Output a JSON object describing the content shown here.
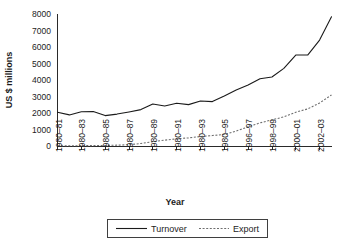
{
  "chart_data": {
    "type": "line",
    "title": "",
    "xlabel": "Year",
    "ylabel": "US $ millions",
    "ylim": [
      0,
      8000
    ],
    "ytick_labels": [
      "8000",
      "7000",
      "6000",
      "5000",
      "4000",
      "3000",
      "2000",
      "1000",
      "0"
    ],
    "ytick_values": [
      8000,
      7000,
      6000,
      5000,
      4000,
      3000,
      2000,
      1000,
      0
    ],
    "grid": false,
    "legend_position": "bottom-center",
    "x": [
      "1980-81",
      "1981-82",
      "1982-83",
      "1983-84",
      "1984-85",
      "1985-86",
      "1986-87",
      "1987-88",
      "1988-89",
      "1989-90",
      "1990-91",
      "1991-92",
      "1992-93",
      "1993-94",
      "1994-95",
      "1995-96",
      "1996-97",
      "1997-98",
      "1998-99",
      "1999-00",
      "2000-01",
      "2001-02",
      "2002-03",
      "2003-04"
    ],
    "xtick_labels": [
      "1980–81",
      "1980–83",
      "1980–85",
      "1980–87",
      "1980–89",
      "1980–91",
      "1980–93",
      "1980–95",
      "1996–97",
      "1998–99",
      "2000–01",
      "2002–03"
    ],
    "xtick_indices": [
      0,
      2,
      4,
      6,
      8,
      10,
      12,
      14,
      16,
      18,
      20,
      22
    ],
    "series": [
      {
        "name": "Turnover",
        "style": "solid",
        "color": "#1a1a1a",
        "values": [
          2060,
          1900,
          2090,
          2100,
          1860,
          1950,
          2080,
          2220,
          2560,
          2440,
          2600,
          2520,
          2740,
          2700,
          3040,
          3400,
          3700,
          4080,
          4180,
          4700,
          5500,
          5500,
          6400,
          7800
        ]
      },
      {
        "name": "Export",
        "style": "dashed",
        "color": "#6e6e6e",
        "values": [
          40,
          45,
          50,
          55,
          60,
          80,
          110,
          180,
          290,
          380,
          460,
          520,
          600,
          660,
          720,
          930,
          1180,
          1420,
          1600,
          1780,
          2060,
          2260,
          2620,
          3100
        ]
      }
    ]
  },
  "axes": {
    "ylabel": "US $ millions",
    "xlabel": "Year"
  },
  "legend": {
    "items": [
      {
        "label": "Turnover",
        "style": "solid"
      },
      {
        "label": "Export",
        "style": "dashed"
      }
    ]
  }
}
